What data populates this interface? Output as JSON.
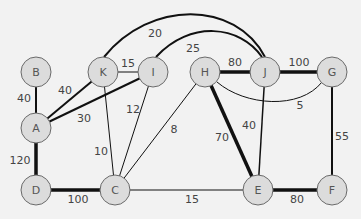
{
  "graph": {
    "nodes": [
      {
        "id": "B",
        "label": "B",
        "x": 36,
        "y": 72
      },
      {
        "id": "K",
        "label": "K",
        "x": 103,
        "y": 72
      },
      {
        "id": "I",
        "label": "I",
        "x": 153,
        "y": 72
      },
      {
        "id": "H",
        "label": "H",
        "x": 205,
        "y": 72
      },
      {
        "id": "J",
        "label": "J",
        "x": 265,
        "y": 72
      },
      {
        "id": "G",
        "label": "G",
        "x": 332,
        "y": 72
      },
      {
        "id": "A",
        "label": "A",
        "x": 36,
        "y": 128
      },
      {
        "id": "D",
        "label": "D",
        "x": 36,
        "y": 190
      },
      {
        "id": "C",
        "label": "C",
        "x": 115,
        "y": 190
      },
      {
        "id": "E",
        "label": "E",
        "x": 258,
        "y": 190
      },
      {
        "id": "F",
        "label": "F",
        "x": 332,
        "y": 190
      }
    ],
    "edges": [
      {
        "from": "B",
        "to": "A",
        "weight": "40",
        "width": 2,
        "lx": 24,
        "ly": 98
      },
      {
        "from": "A",
        "to": "D",
        "weight": "120",
        "width": 3.5,
        "lx": 20,
        "ly": 160
      },
      {
        "from": "D",
        "to": "C",
        "weight": "100",
        "width": 3.5,
        "lx": 78,
        "ly": 199
      },
      {
        "from": "A",
        "to": "K",
        "weight": "40",
        "width": 2,
        "lx": 65,
        "ly": 90
      },
      {
        "from": "A",
        "to": "I",
        "weight": "30",
        "width": 2,
        "lx": 84,
        "ly": 118
      },
      {
        "from": "K",
        "to": "I",
        "weight": "15",
        "width": 1,
        "lx": 128,
        "ly": 63
      },
      {
        "from": "K",
        "to": "C",
        "weight": "10",
        "width": 1,
        "lx": 101,
        "ly": 151
      },
      {
        "from": "I",
        "to": "C",
        "weight": "12",
        "width": 1,
        "lx": 133,
        "ly": 109
      },
      {
        "from": "H",
        "to": "C",
        "weight": "8",
        "width": 1,
        "lx": 174,
        "ly": 129
      },
      {
        "from": "C",
        "to": "E",
        "weight": "15",
        "width": 1,
        "lx": 192,
        "ly": 199
      },
      {
        "from": "H",
        "to": "J",
        "weight": "80",
        "width": 3.5,
        "lx": 235,
        "ly": 62
      },
      {
        "from": "J",
        "to": "G",
        "weight": "100",
        "width": 3.5,
        "lx": 299,
        "ly": 62
      },
      {
        "from": "H",
        "to": "E",
        "weight": "70",
        "width": 3.5,
        "lx": 222,
        "ly": 137
      },
      {
        "from": "J",
        "to": "E",
        "weight": "40",
        "width": 1.5,
        "lx": 249,
        "ly": 125
      },
      {
        "from": "G",
        "to": "F",
        "weight": "55",
        "width": 2,
        "lx": 342,
        "ly": 136
      },
      {
        "from": "E",
        "to": "F",
        "weight": "80",
        "width": 3.5,
        "lx": 297,
        "ly": 199
      },
      {
        "from": "K",
        "to": "J",
        "weight": "20",
        "width": 2,
        "curve": "M 104 57 C 150 0, 235 0, 265 57",
        "lx": 155,
        "ly": 33
      },
      {
        "from": "I",
        "to": "J",
        "weight": "25",
        "width": 2,
        "curve": "M 156 57 C 190 20, 240 25, 262 57",
        "lx": 193,
        "ly": 48
      },
      {
        "from": "H",
        "to": "G",
        "weight": "5",
        "width": 1,
        "curve": "M 217 82 C 245 106, 300 110, 322 82",
        "lx": 300,
        "ly": 105
      }
    ]
  },
  "colors": {
    "background": "#f2f2f2",
    "node_fill": "#dcdcdc",
    "node_stroke": "#6a6a6a",
    "edge": "#111111",
    "label": "#444444"
  }
}
